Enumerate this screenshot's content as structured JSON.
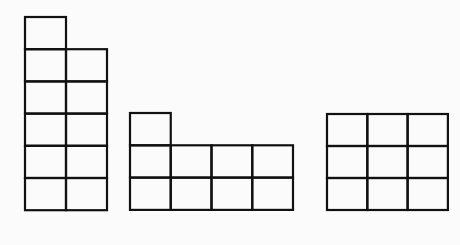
{
  "diagram": {
    "line_color": "#111111",
    "background_color": "#fbfbfb",
    "figures": [
      {
        "name": "figure-1",
        "square_count": 11,
        "origin": [
          25,
          17
        ],
        "cell_w": 41,
        "cell_h": 32.2,
        "cells": [
          [
            0,
            0
          ],
          [
            0,
            1
          ],
          [
            1,
            1
          ],
          [
            0,
            2
          ],
          [
            1,
            2
          ],
          [
            0,
            3
          ],
          [
            1,
            3
          ],
          [
            0,
            4
          ],
          [
            1,
            4
          ],
          [
            0,
            5
          ],
          [
            1,
            5
          ]
        ]
      },
      {
        "name": "figure-2",
        "square_count": 9,
        "origin": [
          130,
          113
        ],
        "cell_w": 40.75,
        "cell_h": 32.3,
        "cells": [
          [
            0,
            0
          ],
          [
            0,
            1
          ],
          [
            1,
            1
          ],
          [
            2,
            1
          ],
          [
            3,
            1
          ],
          [
            0,
            2
          ],
          [
            1,
            2
          ],
          [
            2,
            2
          ],
          [
            3,
            2
          ]
        ]
      },
      {
        "name": "figure-3",
        "square_count": 9,
        "origin": [
          327,
          114
        ],
        "cell_w": 40.3,
        "cell_h": 32,
        "cells": [
          [
            0,
            0
          ],
          [
            1,
            0
          ],
          [
            2,
            0
          ],
          [
            0,
            1
          ],
          [
            1,
            1
          ],
          [
            2,
            1
          ],
          [
            0,
            2
          ],
          [
            1,
            2
          ],
          [
            2,
            2
          ]
        ]
      }
    ]
  }
}
